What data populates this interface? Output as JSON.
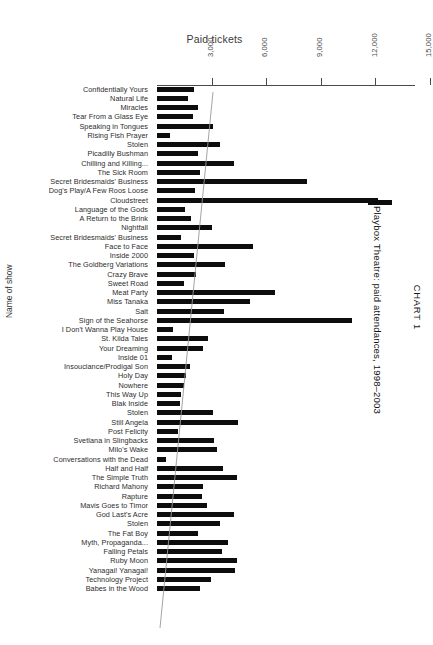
{
  "axis": {
    "top_title": "Paid tickets",
    "left_label": "Name of show",
    "ticks": [
      {
        "value": 3000,
        "label": "3,000"
      },
      {
        "value": 6000,
        "label": "6,000"
      },
      {
        "value": 9000,
        "label": "9,000"
      },
      {
        "value": 12000,
        "label": "12,000"
      },
      {
        "value": 15000,
        "label": "15,000"
      }
    ]
  },
  "caption": {
    "number": "CHART 1",
    "title": "Playbox Theatre: paid attendances, 1998–2003"
  },
  "chart_data": {
    "type": "bar",
    "orientation": "horizontal",
    "title": "Playbox Theatre: paid attendances, 1998–2003",
    "xlabel": "Paid tickets",
    "ylabel": "Name of show",
    "xlim": [
      0,
      16000
    ],
    "grid": false,
    "legend": null,
    "annotations": [
      "faint diagonal trend line overlaid across the bars"
    ],
    "tick_labels": [
      "3,000",
      "6,000",
      "9,000",
      "12,000",
      "15,000"
    ],
    "categories": [
      "Confidentially Yours",
      "Natural Life",
      "Miracles",
      "Tear From a Glass Eye",
      "Speaking in Tongues",
      "Rising Fish Prayer",
      "Stolen",
      "Picadilly Bushman",
      "Chilling and Killing...",
      "The Sick Room",
      "Secret Bridesmaids' Business",
      "Dog's Play/A Few Roos Loose",
      "Cloudstreet",
      "Language of the Gods",
      "A Return to the Brink",
      "Nightfall",
      "Secret Bridesmaids' Business",
      "Face to Face",
      "Inside 2000",
      "The Goldberg Variations",
      "Crazy Brave",
      "Sweet Road",
      "Meat Party",
      "Miss Tanaka",
      "Salt",
      "Sign of the Seahorse",
      "I Don't Wanna Play House",
      "St. Kilda Tales",
      "Your Dreaming",
      "Inside 01",
      "Insouciance/Prodigal Son",
      "Holy Day",
      "Nowhere",
      "This Way Up",
      "Blak Inside",
      "Stolen",
      "Still Angela",
      "Post Felicity",
      "Svetlana in Slingbacks",
      "Milo's Wake",
      "Conversations with the Dead",
      "Half and Half",
      "The Simple Truth",
      "Richard Mahony",
      "Rapture",
      "Mavis Goes to Timor",
      "God Last's Acre",
      "Stolen",
      "The Fat Boy",
      "Myth, Propaganda...",
      "Falling Petals",
      "Ruby Moon",
      "Yanagai! Yanagai!",
      "Technology Project",
      "Babes in the Wood"
    ],
    "values": [
      2060,
      1700,
      2270,
      1980,
      3100,
      700,
      3450,
      2250,
      4250,
      2380,
      8250,
      2080,
      12120,
      1550,
      1870,
      3000,
      1330,
      5300,
      2010,
      3750,
      2160,
      1500,
      6500,
      5100,
      3700,
      10700,
      900,
      2780,
      2520,
      830,
      1800,
      1580,
      1480,
      1340,
      1260,
      3100,
      4450,
      1180,
      3120,
      3320,
      480,
      3600,
      4380,
      2540,
      2480,
      2720,
      4210,
      3480,
      2280,
      3900,
      3580,
      4400,
      4280,
      2950,
      2390
    ]
  }
}
